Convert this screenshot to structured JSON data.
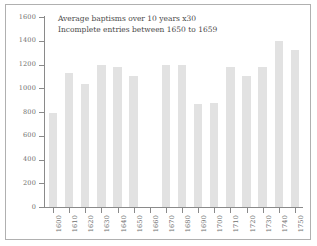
{
  "chart_data": {
    "type": "bar",
    "title": "",
    "subtitle": "",
    "xlabel": "",
    "ylabel": "",
    "annotations": [
      "Average baptisms over 10 years x30",
      "Incomplete entries between 1650 to 1659"
    ],
    "categories": [
      "1600",
      "1610",
      "1620",
      "1630",
      "1640",
      "1650",
      "1660",
      "1670",
      "1680",
      "1690",
      "1700",
      "1710",
      "1720",
      "1730",
      "1740",
      "1750"
    ],
    "values": [
      790,
      1125,
      1040,
      1200,
      1175,
      1100,
      null,
      1200,
      1195,
      865,
      875,
      1180,
      1105,
      1175,
      1400,
      1325
    ],
    "ylim": [
      0,
      1600
    ],
    "yticks": [
      0,
      200,
      400,
      600,
      800,
      1000,
      1200,
      1400,
      1600
    ],
    "ytick_labels": [
      "0",
      "200",
      "400",
      "600",
      "800",
      "1000",
      "1200",
      "1400",
      "1600"
    ],
    "grid": false,
    "legend": false,
    "bar_color": "#e2e2e2",
    "axis_color": "#8a8a8a",
    "text_color": "#6e6e6e",
    "frame_color": "#b0b0b0"
  }
}
